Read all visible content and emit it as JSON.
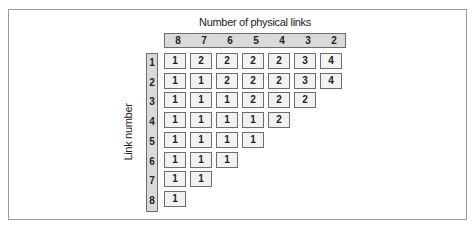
{
  "diagram": {
    "column_axis_title": "Number of physical links",
    "row_axis_title": "Link number",
    "columns": [
      "8",
      "7",
      "6",
      "5",
      "4",
      "3",
      "2"
    ],
    "rows": [
      "1",
      "2",
      "3",
      "4",
      "5",
      "6",
      "7",
      "8"
    ],
    "matrix": [
      [
        "1",
        "2",
        "2",
        "2",
        "2",
        "3",
        "4"
      ],
      [
        "1",
        "1",
        "2",
        "2",
        "2",
        "3",
        "4"
      ],
      [
        "1",
        "1",
        "1",
        "2",
        "2",
        "2"
      ],
      [
        "1",
        "1",
        "1",
        "1",
        "2"
      ],
      [
        "1",
        "1",
        "1",
        "1"
      ],
      [
        "1",
        "1",
        "1"
      ],
      [
        "1",
        "1"
      ],
      [
        "1"
      ]
    ],
    "colors": {
      "header_fill": "#d9d9d9",
      "cell_fill": "#f2f2f2",
      "border": "#6d6d6d",
      "frame": "#9a9a9a"
    }
  }
}
